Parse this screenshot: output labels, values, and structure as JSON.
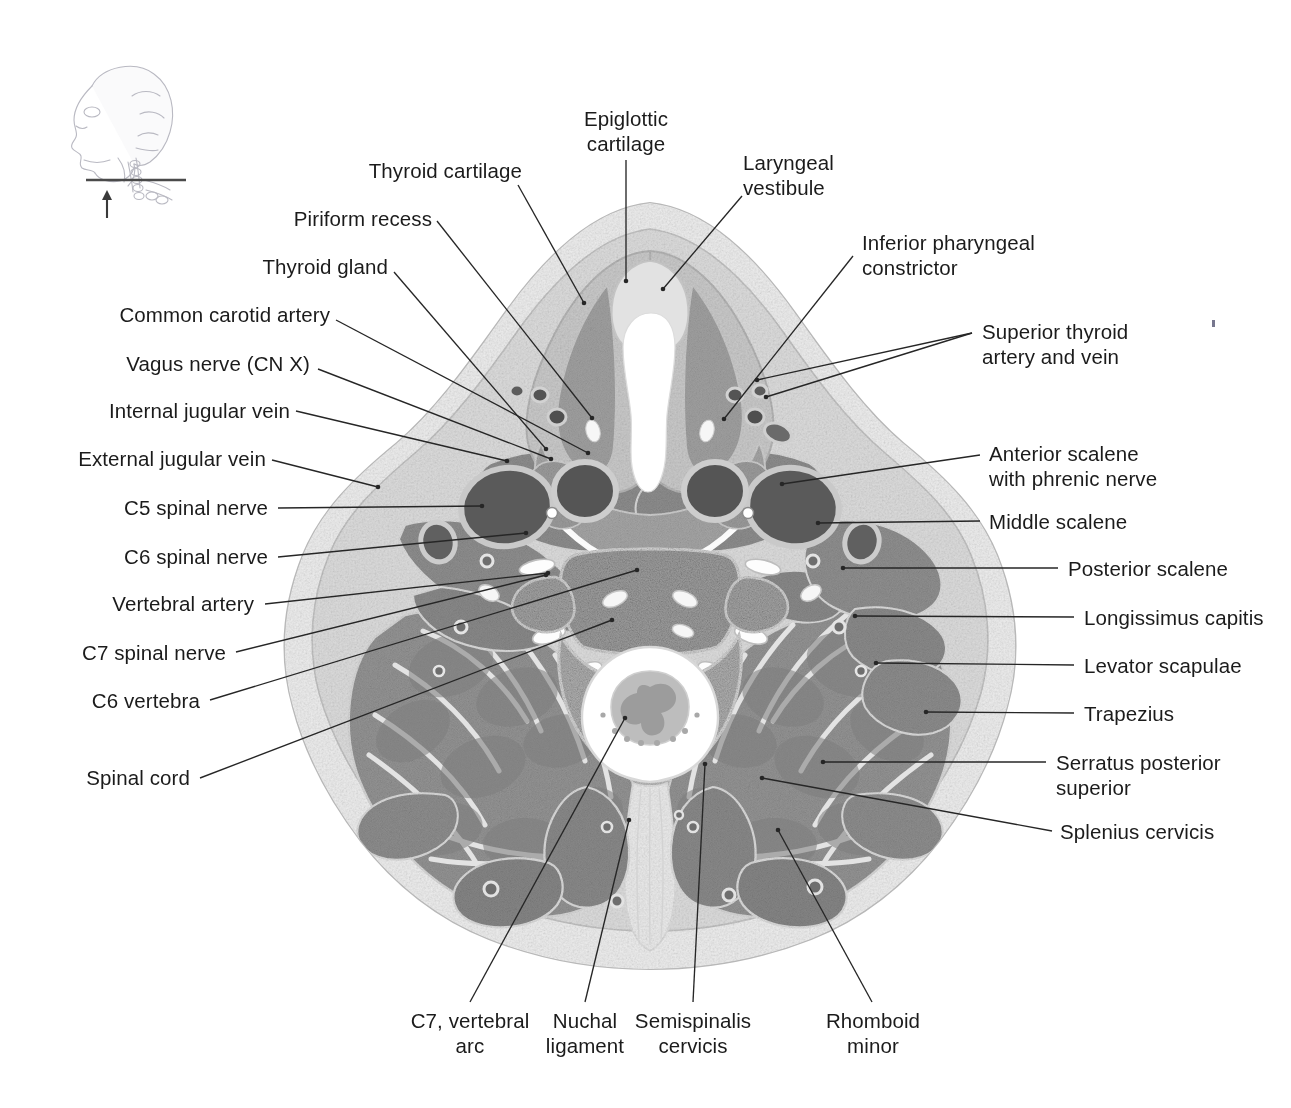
{
  "figure": {
    "type": "anatomical-cross-section",
    "region": "Neck, transverse (axial) section at the level of the C6 vertebra",
    "orientation_icon": "head-lateral-with-section-plane-and-up-arrow"
  },
  "labels": {
    "top": [
      {
        "id": "epiglottic-cartilage",
        "text": "Epiglottic\ncartilage",
        "align": "center"
      },
      {
        "id": "thyroid-cartilage",
        "text": "Thyroid cartilage",
        "align": "right"
      },
      {
        "id": "laryngeal-vestibule",
        "text": "Laryngeal\nvestibule",
        "align": "left"
      }
    ],
    "left": [
      {
        "id": "piriform-recess",
        "text": "Piriform recess"
      },
      {
        "id": "thyroid-gland",
        "text": "Thyroid gland"
      },
      {
        "id": "common-carotid-artery",
        "text": "Common carotid artery"
      },
      {
        "id": "vagus-nerve",
        "text": "Vagus nerve (CN X)"
      },
      {
        "id": "internal-jugular-vein",
        "text": "Internal jugular vein"
      },
      {
        "id": "external-jugular-vein",
        "text": "External jugular vein"
      },
      {
        "id": "c5-spinal-nerve",
        "text": "C5 spinal nerve"
      },
      {
        "id": "c6-spinal-nerve",
        "text": "C6 spinal nerve"
      },
      {
        "id": "vertebral-artery",
        "text": "Vertebral artery"
      },
      {
        "id": "c7-spinal-nerve",
        "text": "C7 spinal nerve"
      },
      {
        "id": "c6-vertebra",
        "text": "C6 vertebra"
      },
      {
        "id": "spinal-cord",
        "text": "Spinal cord"
      }
    ],
    "right": [
      {
        "id": "inferior-pharyngeal-constrictor",
        "text": "Inferior pharyngeal\nconstrictor"
      },
      {
        "id": "superior-thyroid-artery-and-vein",
        "text": "Superior thyroid\nartery and vein"
      },
      {
        "id": "anterior-scalene-with-phrenic-nerve",
        "text": "Anterior scalene\nwith phrenic nerve"
      },
      {
        "id": "middle-scalene",
        "text": "Middle scalene"
      },
      {
        "id": "posterior-scalene",
        "text": "Posterior scalene"
      },
      {
        "id": "longissimus-capitis",
        "text": "Longissimus capitis"
      },
      {
        "id": "levator-scapulae",
        "text": "Levator scapulae"
      },
      {
        "id": "trapezius",
        "text": "Trapezius"
      },
      {
        "id": "serratus-posterior-superior",
        "text": "Serratus posterior\nsuperior"
      },
      {
        "id": "splenius-cervicis",
        "text": "Splenius cervicis"
      }
    ],
    "bottom": [
      {
        "id": "c7-vertebral-arc",
        "text": "C7, vertebral\narc"
      },
      {
        "id": "nuchal-ligament",
        "text": "Nuchal\nligament"
      },
      {
        "id": "semispinalis-cervicis",
        "text": "Semispinalis\ncervicis"
      },
      {
        "id": "rhomboid-minor",
        "text": "Rhomboid\nminor"
      }
    ]
  },
  "colors": {
    "text": "#1b1b1b",
    "leader_line": "#262626",
    "skin_fat": "#e9e9e9",
    "connective": "#d6d6d6",
    "muscle": "#8d8d8d",
    "muscle_dark": "#7a7a7a",
    "vessel_dark": "#5a5a5a",
    "bone_cancellous": "#9a9a9a",
    "airway_white": "#ffffff",
    "background": "#ffffff"
  }
}
